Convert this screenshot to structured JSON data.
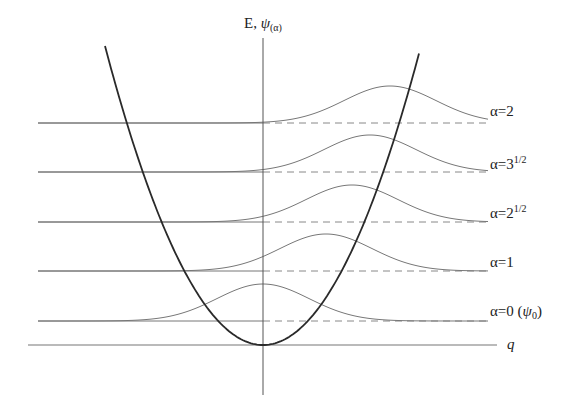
{
  "diagram": {
    "axis": {
      "vertical_label_main": "E, ",
      "vertical_label_psi": "ψ",
      "vertical_label_sub": "(α)",
      "horizontal_label": "q"
    },
    "colors": {
      "parabola": "#2a2a2a",
      "lines": "#777777",
      "dashed": "#888888",
      "text": "#222222"
    },
    "states": [
      {
        "label_prefix": "α=0 (",
        "label_psi": "ψ",
        "label_sub": "0",
        "label_suffix": ")",
        "baseline_y": 321,
        "center_x": 263
      },
      {
        "label_prefix": "α=1",
        "baseline_y": 271,
        "center_x": 326
      },
      {
        "label_prefix": "α=2",
        "label_sup": "1/2",
        "baseline_y": 222,
        "center_x": 352
      },
      {
        "label_prefix": "α=3",
        "label_sup": "1/2",
        "baseline_y": 172,
        "center_x": 370
      },
      {
        "label_prefix": "α=2",
        "baseline_y": 123,
        "center_x": 390
      }
    ],
    "geometry": {
      "axis_x": 263,
      "q_axis_y": 345,
      "parabola_top_y": 48,
      "parabola_left_x": 105,
      "parabola_right_x": 420,
      "wave_amplitude": 37,
      "wave_sigma": 46
    }
  }
}
